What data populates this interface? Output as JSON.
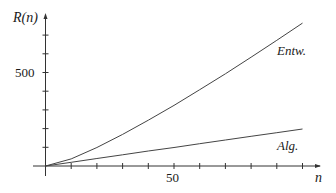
{
  "chart_data": {
    "type": "line",
    "title": "",
    "xlabel": "n",
    "ylabel": "R(n)",
    "xlim": [
      0,
      105
    ],
    "ylim": [
      0,
      800
    ],
    "x_ticks": [
      10,
      20,
      30,
      40,
      50,
      60,
      70,
      80,
      90,
      100
    ],
    "x_tick_labels": [
      {
        "value": 50,
        "label": "50"
      }
    ],
    "y_ticks": [
      100,
      200,
      300,
      400,
      500,
      600,
      700
    ],
    "y_tick_labels": [
      {
        "value": 500,
        "label": "500"
      }
    ],
    "grid": false,
    "legend": "inline labels",
    "x": [
      0,
      10,
      20,
      30,
      40,
      50,
      60,
      70,
      80,
      90,
      100
    ],
    "series": [
      {
        "name": "Entw.",
        "values": [
          0,
          38,
          99,
          169,
          245,
          324,
          408,
          493,
          582,
          672,
          764
        ]
      },
      {
        "name": "Alg.",
        "values": [
          0,
          20,
          40,
          60,
          80,
          99,
          119,
          139,
          159,
          178,
          198
        ]
      }
    ],
    "annotations": [
      {
        "text": "Entw.",
        "near": "upper curve end"
      },
      {
        "text": "Alg.",
        "near": "lower curve end"
      }
    ]
  },
  "labels": {
    "y_axis": "R(n)",
    "x_axis": "n",
    "y_tick_500": "500",
    "x_tick_50": "50",
    "series_upper": "Entw.",
    "series_lower": "Alg."
  }
}
